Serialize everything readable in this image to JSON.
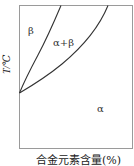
{
  "diagram": {
    "type": "phase-diagram",
    "y_axis_label": "T/℃",
    "x_axis_label": "合金元素含量(%)",
    "regions": [
      {
        "id": "beta",
        "label": "β"
      },
      {
        "id": "alpha-beta",
        "label": "α+β"
      },
      {
        "id": "alpha",
        "label": "α"
      }
    ],
    "colors": {
      "line": "#333333",
      "frame": "#999999",
      "background": "#ffffff"
    }
  }
}
